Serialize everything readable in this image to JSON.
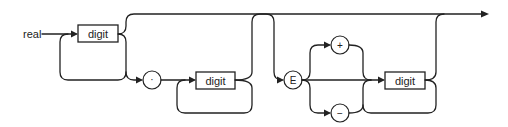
{
  "diagram": {
    "type": "syntax-railroad",
    "start_label": "real",
    "nodes": {
      "digit_int": "digit",
      "dot": "·",
      "digit_frac": "digit",
      "exp": "E",
      "plus": "+",
      "minus": "−",
      "digit_exp": "digit"
    },
    "colors": {
      "line": "#222222",
      "background": "#ffffff"
    }
  }
}
